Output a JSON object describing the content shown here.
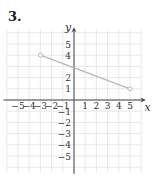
{
  "problem": {
    "number": "3."
  },
  "chart_data": {
    "type": "line",
    "title": "",
    "xlabel": "x",
    "ylabel": "y",
    "xlim": [
      -6,
      6
    ],
    "ylim": [
      -6,
      6
    ],
    "grid": true,
    "x_ticks": [
      "-5",
      "-4",
      "-3",
      "-2",
      "-1",
      "1",
      "2",
      "3",
      "4",
      "5"
    ],
    "y_ticks": [
      "5",
      "4",
      "2",
      "1",
      "-1",
      "-2",
      "-3",
      "-4",
      "-5"
    ],
    "series": [
      {
        "name": "segment",
        "points": [
          {
            "x": -3,
            "y": 4
          },
          {
            "x": 5,
            "y": 1
          }
        ],
        "color": "#b8b8b8"
      }
    ],
    "colors": {
      "grid": "#e2e2e2",
      "axis": "#444444",
      "segment": "#b8b8b8"
    }
  }
}
